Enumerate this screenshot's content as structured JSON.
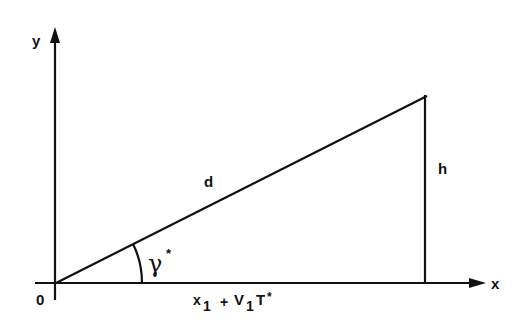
{
  "diagram": {
    "type": "right-triangle geometry",
    "axes": {
      "x_label": "x",
      "y_label": "y",
      "origin_label": "0"
    },
    "labels": {
      "hypotenuse": "d",
      "height": "h",
      "angle": "γ",
      "angle_superscript": "*",
      "base_x": "x",
      "base_x_sub": "1",
      "base_plus": "+",
      "base_v": "V",
      "base_v_sub": "1",
      "base_t": "T",
      "base_t_sup": "*"
    },
    "colors": {
      "ink": "#111111",
      "background": "#ffffff"
    }
  }
}
